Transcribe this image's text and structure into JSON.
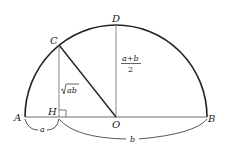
{
  "points": {
    "A": {
      "label": "A",
      "x": 25,
      "y": 117
    },
    "B": {
      "label": "B",
      "x": 207,
      "y": 117
    },
    "O": {
      "label": "O",
      "x": 116,
      "y": 117
    },
    "D": {
      "label": "D",
      "x": 116,
      "y": 25
    },
    "C": {
      "label": "C",
      "x": 59,
      "y": 45
    },
    "H": {
      "label": "H",
      "x": 59,
      "y": 117
    }
  },
  "segments": {
    "CH_label": "ab",
    "OD_label_num": "a+b",
    "OD_label_den": "2",
    "AH_label": "a",
    "HB_label": "b"
  },
  "colors": {
    "arc": "#222222",
    "CO": "#222222",
    "gray_lines": "#8a8a8a",
    "diameter": "#6f6f6f"
  }
}
